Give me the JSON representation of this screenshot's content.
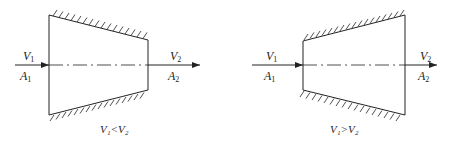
{
  "figure": {
    "left": {
      "inlet_velocity": "V",
      "inlet_velocity_sub": "1",
      "inlet_area": "A",
      "inlet_area_sub": "1",
      "outlet_velocity": "V",
      "outlet_velocity_sub": "2",
      "outlet_area": "A",
      "outlet_area_sub": "2",
      "caption": "V₁<V₂",
      "type": "converging nozzle"
    },
    "right": {
      "inlet_velocity": "V",
      "inlet_velocity_sub": "1",
      "inlet_area": "A",
      "inlet_area_sub": "1",
      "outlet_velocity": "V",
      "outlet_velocity_sub": "2",
      "outlet_area": "A",
      "outlet_area_sub": "2",
      "caption": "V₁>V₂",
      "type": "diverging diffuser"
    },
    "colors": {
      "line": "#222222",
      "background": "#ffffff"
    }
  }
}
